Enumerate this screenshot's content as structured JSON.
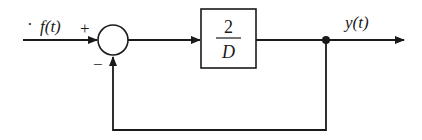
{
  "diagram": {
    "type": "block-diagram",
    "input": {
      "label": "f(t)",
      "prefix_mark": "·"
    },
    "summing_junction": {
      "plus_sign": "+",
      "minus_sign": "−"
    },
    "block": {
      "numerator": "2",
      "denominator": "D"
    },
    "output": {
      "label": "y(t)"
    },
    "colors": {
      "stroke": "#1a1a1a",
      "background": "#ffffff"
    }
  }
}
